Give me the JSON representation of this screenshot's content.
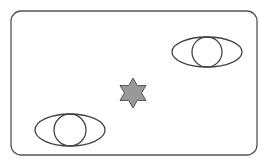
{
  "canvas": {
    "width": 266,
    "height": 164,
    "background": "#ffffff"
  },
  "frame": {
    "x": 11,
    "y": 11,
    "width": 246,
    "height": 144,
    "rx": 10,
    "stroke": "#555555"
  },
  "shapes": {
    "eye_top_right": {
      "cx": 207,
      "cy": 52,
      "rx": 35,
      "ry": 15,
      "pupil_r": 15,
      "stroke": "#444444"
    },
    "eye_bottom_left": {
      "cx": 70,
      "cy": 130,
      "rx": 35,
      "ry": 16,
      "pupil_r": 16,
      "stroke": "#444444"
    },
    "star": {
      "cx": 133,
      "cy": 93,
      "outer_r": 15,
      "inner_r": 8.5,
      "points": 6,
      "fill": "#999999",
      "stroke": "#555555"
    }
  }
}
